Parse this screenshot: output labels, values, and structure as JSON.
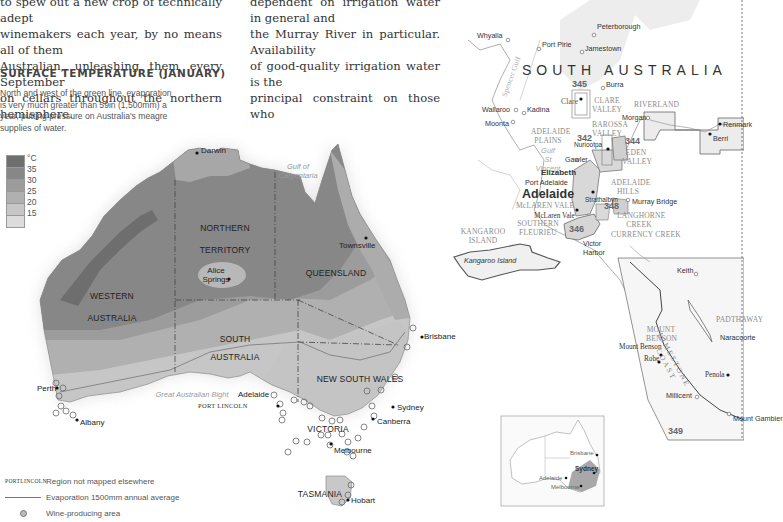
{
  "article": {
    "left_column": [
      "to spew out a new crop of technically adept",
      "winemakers each year, by no means all of them",
      "Australian, unleashing them every September",
      "on cellars throughout the northern hemisphere."
    ],
    "right_column": [
      "dependent on irrigation water in general and",
      "the Murray River in particular. Availability",
      "of good-quality irrigation water is the",
      "principal constraint on those who"
    ]
  },
  "temperature_map": {
    "title": "SURFACE TEMPERATURE (JANUARY)",
    "caption": "North and west of the green line, evaporation is very much greater than 59in (1,500mm) a year, putting pressure on Australia's meagre supplies of water.",
    "scale": {
      "unit": "°C",
      "ticks": [
        "35",
        "30",
        "25",
        "20",
        "15"
      ],
      "colors": [
        "#6e6e6e",
        "#878787",
        "#9c9c9c",
        "#b0b0b0",
        "#c6c6c6",
        "#dcdcdc"
      ]
    },
    "states": {
      "western_australia": [
        "WESTERN",
        "AUSTRALIA"
      ],
      "northern_territory": [
        "NORTHERN",
        "TERRITORY"
      ],
      "queensland": "QUEENSLAND",
      "south_australia": [
        "SOUTH",
        "AUSTRALIA"
      ],
      "new_south_wales": "NEW SOUTH WALES",
      "victoria": "VICTORIA",
      "tasmania": "TASMANIA"
    },
    "cities": {
      "darwin": "Darwin",
      "townsville": "Townsville",
      "alice_springs": [
        "Alice",
        "Springs"
      ],
      "brisbane": "Brisbane",
      "perth": "Perth",
      "albany": "Albany",
      "adelaide": "Adelaide",
      "sydney": "Sydney",
      "canberra": "Canberra",
      "melbourne": "Melbourne",
      "hobart": "Hobart"
    },
    "seas": {
      "gulf_of_carpentaria": [
        "Gulf of",
        "Carpentaria"
      ],
      "great_australian_bight": "Great Australian Bight"
    },
    "port_lincoln": "PORT LINCOLN",
    "legend": {
      "port_key": [
        "PORT",
        "LINCOLN"
      ],
      "region_not_mapped": "Region not mapped elsewhere",
      "evaporation_line": "Evaporation 1500mm annual average",
      "wine_area": "Wine-producing area"
    }
  },
  "sa_map": {
    "title": "SOUTH AUSTRALIA",
    "towns": {
      "peterborough": "Peterborough",
      "whyalla": "Whyalla",
      "port_pirie": "Port Pirie",
      "jamestown": "Jamestown",
      "burra": "Burra",
      "clare": "Clare",
      "wallaroo": "Wallaroo",
      "kadina": "Kadina",
      "moonta": "Moonta",
      "morgan": "Morgan",
      "renmark": "Renmark",
      "berri": "Berri",
      "nuriootpa": "Nuriootpa",
      "gawler": "Gawler",
      "elizabeth": "Elizabeth",
      "port_adelaide": "Port Adelaide",
      "adelaide": "Adelaide",
      "strathalbyn": "Strathalbyn",
      "murray_bridge": "Murray Bridge",
      "mclaren_vale_town": "McLaren Vale",
      "victor_harbor": [
        "Victor",
        "Harbor"
      ],
      "kangaroo_island_town": "Kangaroo Island",
      "keith": "Keith",
      "mount_benson_town": "Mount Benson",
      "robe": "Robe",
      "naracoorte": "Naracoorte",
      "penola": "Penola",
      "millicent": "Millicent",
      "mount_gambier": "Mount Gambier"
    },
    "regions": {
      "clare_valley": [
        "CLARE",
        "VALLEY"
      ],
      "riverland": "RIVERLAND",
      "barossa_valley": [
        "BAROSSA",
        "VALLEY"
      ],
      "adelaide_plains": [
        "ADELAIDE",
        "PLAINS"
      ],
      "eden_valley": [
        "EDEN",
        "VALLEY"
      ],
      "adelaide_hills": [
        "ADELAIDE",
        "HILLS"
      ],
      "mclaren_vale": "McLAREN VALE",
      "southern_fleurieu": [
        "SOUTHERN",
        "FLEURIEU"
      ],
      "langhorne_creek": [
        "LANGHORNE",
        "CREEK"
      ],
      "currency_creek": "CURRENCY CREEK",
      "kangaroo_island": [
        "KANGAROO",
        "ISLAND"
      ],
      "mount_benson": [
        "MOUNT",
        "BENSON"
      ],
      "limestone_coast": "LIMESTONE COAST",
      "padthaway": "PADTHAWAY"
    },
    "seas": {
      "spencer_gulf": "Spencer Gulf",
      "gulf_st_vincent": [
        "Gulf",
        "St",
        "Vincent"
      ]
    },
    "page_refs": [
      "345",
      "342",
      "344",
      "348",
      "346",
      "349"
    ],
    "inset": {
      "brisbane": "Brisbane",
      "sydney": "Sydney",
      "adelaide": "Adelaide",
      "melbourne": "Melbourne"
    }
  }
}
